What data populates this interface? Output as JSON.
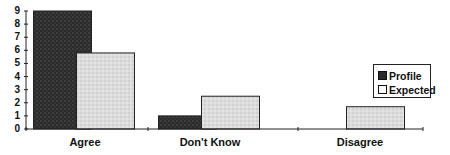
{
  "chart_data": {
    "type": "bar",
    "title": "",
    "xlabel": "",
    "ylabel": "",
    "categories": [
      "Agree",
      "Don't Know",
      "Disagree"
    ],
    "series": [
      {
        "name": "Profile",
        "values": [
          9,
          1,
          0
        ],
        "color": "#2b2b2b"
      },
      {
        "name": "Expected",
        "values": [
          5.8,
          2.5,
          1.7
        ],
        "color": "#d9d9d9"
      }
    ],
    "ylim": [
      0,
      9
    ],
    "yticks": [
      "0",
      "1",
      "2",
      "3",
      "4",
      "5",
      "6",
      "7",
      "8",
      "9"
    ],
    "grid": false,
    "legend_position": "right"
  },
  "legend": {
    "items": [
      {
        "label": "Profile",
        "color": "#2b2b2b"
      },
      {
        "label": "Expected",
        "color": "#ffffff"
      }
    ]
  }
}
